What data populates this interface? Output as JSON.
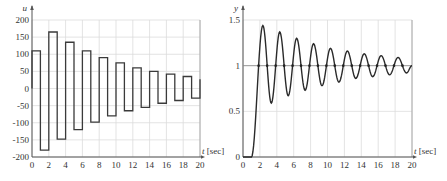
{
  "chart_data": [
    {
      "type": "line",
      "step": true,
      "title": "",
      "xlabel": "t [sec]",
      "ylabel": "u",
      "xlim": [
        0,
        20
      ],
      "ylim": [
        -200,
        200
      ],
      "xticks": [
        0,
        2,
        4,
        6,
        8,
        10,
        12,
        14,
        16,
        18,
        20
      ],
      "yticks": [
        200,
        150,
        100,
        50,
        0,
        -50,
        -100,
        -150,
        -200
      ],
      "grid": true,
      "legend": null,
      "series": [
        {
          "name": "u",
          "x": [
            0,
            1,
            2,
            3,
            4,
            5,
            6,
            7,
            8,
            9,
            10,
            11,
            12,
            13,
            14,
            15,
            16,
            17,
            18,
            19,
            20
          ],
          "values": [
            110,
            -180,
            165,
            -148,
            135,
            -120,
            110,
            -98,
            90,
            -80,
            75,
            -65,
            60,
            -55,
            50,
            -43,
            42,
            -35,
            35,
            -28,
            27
          ]
        }
      ]
    },
    {
      "type": "line",
      "title": "",
      "xlabel": "t [sec]",
      "ylabel": "y",
      "xlim": [
        0,
        20
      ],
      "ylim": [
        0,
        1.5
      ],
      "xticks": [
        0,
        2,
        4,
        6,
        8,
        10,
        12,
        14,
        16,
        18,
        20
      ],
      "yticks": [
        0,
        0.5,
        1,
        1.5
      ],
      "grid": true,
      "legend": null,
      "reference_line": 1,
      "series": [
        {
          "name": "y",
          "start_time": 1.0,
          "period": 2.0,
          "peaks": [
            [
              2.35,
              1.44
            ],
            [
              4.35,
              1.37
            ],
            [
              6.35,
              1.3
            ],
            [
              8.35,
              1.24
            ],
            [
              10.35,
              1.19
            ],
            [
              12.35,
              1.16
            ],
            [
              14.35,
              1.13
            ],
            [
              16.35,
              1.11
            ],
            [
              18.35,
              1.09
            ]
          ],
          "troughs": [
            [
              3.35,
              0.59
            ],
            [
              5.35,
              0.67
            ],
            [
              7.35,
              0.73
            ],
            [
              9.35,
              0.78
            ],
            [
              11.35,
              0.82
            ],
            [
              13.35,
              0.86
            ],
            [
              15.35,
              0.88
            ],
            [
              17.35,
              0.9
            ],
            [
              19.35,
              0.92
            ]
          ],
          "end_value": 1.0
        }
      ]
    }
  ]
}
